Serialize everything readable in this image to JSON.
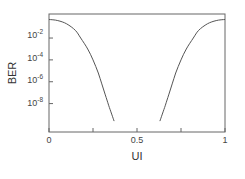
{
  "chart_data": {
    "type": "line",
    "title": "",
    "xlabel": "UI",
    "ylabel": "BER",
    "xlim": [
      0,
      1
    ],
    "ylim_log10": [
      -10.6,
      0.2
    ],
    "yscale": "log",
    "grid": false,
    "legend": null,
    "x_ticks": [
      0,
      0.25,
      0.5,
      0.75,
      1
    ],
    "x_tick_labels": [
      "0",
      "",
      "0.5",
      "",
      "1"
    ],
    "y_ticks_log10": [
      -2,
      -4,
      -6,
      -8
    ],
    "y_tick_labels": [
      "10-2",
      "10-4",
      "10-6",
      "10-8"
    ],
    "series": [
      {
        "name": "left bathtub",
        "x": [
          0.0,
          0.05,
          0.1,
          0.15,
          0.18,
          0.22,
          0.25,
          0.28,
          0.3,
          0.32,
          0.34,
          0.37
        ],
        "log10_y": [
          -0.3,
          -0.4,
          -0.7,
          -1.3,
          -2.0,
          -3.0,
          -4.0,
          -5.2,
          -6.2,
          -7.2,
          -8.2,
          -9.6
        ]
      },
      {
        "name": "right bathtub",
        "x": [
          0.63,
          0.66,
          0.68,
          0.7,
          0.72,
          0.75,
          0.78,
          0.82,
          0.85,
          0.9,
          0.95,
          1.0
        ],
        "log10_y": [
          -9.6,
          -8.2,
          -7.2,
          -6.2,
          -5.2,
          -4.0,
          -3.0,
          -2.0,
          -1.3,
          -0.7,
          -0.4,
          -0.3
        ]
      }
    ]
  },
  "labels": {
    "xlabel": "UI",
    "ylabel": "BER",
    "x0": "0",
    "x05": "0.5",
    "x1": "1",
    "y_base": "10",
    "y_exp": [
      "-2",
      "-4",
      "-6",
      "-8"
    ]
  }
}
